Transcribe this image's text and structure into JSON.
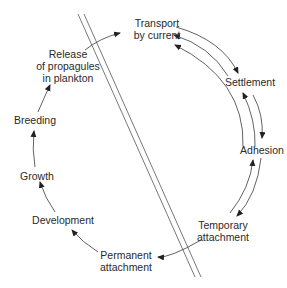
{
  "diagram": {
    "title": "",
    "nodes": [
      {
        "id": "transport",
        "label": "Transport\nby current",
        "lines": [
          "Transport",
          "by current"
        ]
      },
      {
        "id": "settlement",
        "label": "Settlement",
        "lines": [
          "Settlement"
        ]
      },
      {
        "id": "adhesion",
        "label": "Adhesion",
        "lines": [
          "Adhesion"
        ]
      },
      {
        "id": "temporary",
        "label": "Temporary attachment",
        "lines": [
          "Temporary",
          "attachment"
        ]
      },
      {
        "id": "permanent",
        "label": "Permanent attachment",
        "lines": [
          "Permanent",
          "attachment"
        ]
      },
      {
        "id": "development",
        "label": "Development",
        "lines": [
          "Development"
        ]
      },
      {
        "id": "growth",
        "label": "Growth",
        "lines": [
          "Growth"
        ]
      },
      {
        "id": "breeding",
        "label": "Breeding",
        "lines": [
          "Breeding"
        ]
      },
      {
        "id": "release",
        "label": "Release of propagules in plankton",
        "lines": [
          "Release",
          "of propagules",
          "in plankton"
        ]
      }
    ],
    "edges": [
      {
        "from": "release",
        "to": "transport"
      },
      {
        "from": "transport",
        "to": "settlement"
      },
      {
        "from": "settlement",
        "to": "transport"
      },
      {
        "from": "adhesion",
        "to": "transport"
      },
      {
        "from": "settlement",
        "to": "adhesion"
      },
      {
        "from": "adhesion",
        "to": "settlement"
      },
      {
        "from": "adhesion",
        "to": "temporary"
      },
      {
        "from": "temporary",
        "to": "adhesion"
      },
      {
        "from": "temporary",
        "to": "permanent"
      },
      {
        "from": "permanent",
        "to": "development"
      },
      {
        "from": "development",
        "to": "growth"
      },
      {
        "from": "growth",
        "to": "breeding"
      },
      {
        "from": "breeding",
        "to": "release"
      }
    ],
    "divider": {
      "description": "double diagonal line separating reversible and irreversible phases"
    },
    "colors": {
      "line": "#3a3a3a",
      "text": "#2a2a2a",
      "background": "#ffffff"
    }
  }
}
